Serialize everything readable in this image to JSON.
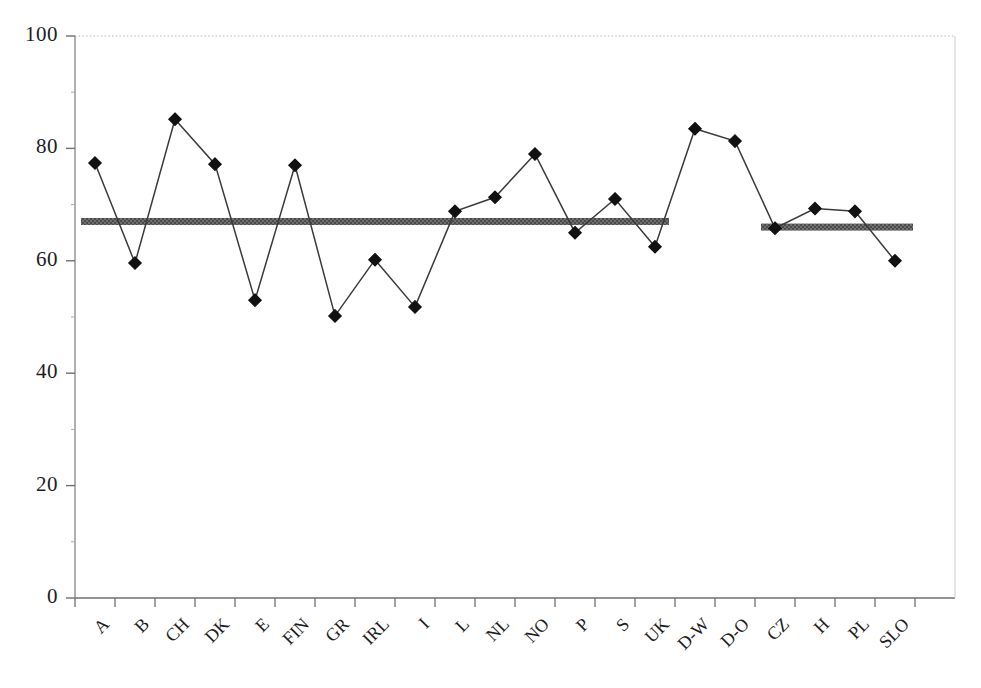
{
  "chart_data": {
    "type": "line",
    "title": "",
    "subtitle": "",
    "xlabel": "",
    "ylabel": "",
    "ylim": [
      0,
      100
    ],
    "yticks": [
      0,
      20,
      40,
      60,
      80,
      100
    ],
    "ytick_labels": [
      "0",
      "20",
      "40",
      "60",
      "80",
      "100"
    ],
    "grid": false,
    "grid_note": "dotted gridline at y=100 (top of plot frame) only",
    "legend": "none",
    "marker": "filled-diamond",
    "line_color": "#3a3a3a",
    "marker_color": "#111111",
    "axis_color": "#9a9a9a",
    "categories": [
      "A",
      "B",
      "CH",
      "DK",
      "E",
      "FIN",
      "GR",
      "IRL",
      "I",
      "L",
      "NL",
      "NO",
      "P",
      "S",
      "UK",
      "D-W",
      "D-O",
      "CZ",
      "H",
      "PL",
      "SLO"
    ],
    "series": [
      {
        "name": "value",
        "values": [
          77.4,
          59.6,
          85.2,
          77.2,
          53.0,
          77.0,
          50.2,
          60.2,
          51.8,
          68.8,
          71.3,
          79.0,
          65.0,
          71.0,
          62.5,
          83.5,
          81.3,
          65.8,
          69.3,
          68.8,
          60.0
        ]
      }
    ],
    "reference_bands": [
      {
        "name": "western-europe-average",
        "value": 67.0,
        "from_category": "A",
        "to_category": "UK",
        "color": "#6e6e6e",
        "style": "thick-hatched-band"
      },
      {
        "name": "eastern-europe-average",
        "value": 66.0,
        "from_category": "CZ",
        "to_category": "SLO",
        "color": "#6e6e6e",
        "style": "thick-hatched-band"
      }
    ]
  }
}
